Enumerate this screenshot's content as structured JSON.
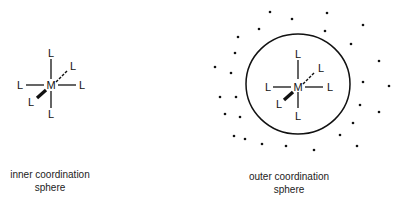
{
  "diagram": {
    "metal_symbol": "M",
    "ligand_symbol": "L",
    "inner": {
      "caption_line1": "inner coordination",
      "caption_line2": "sphere"
    },
    "outer": {
      "caption_line1": "outer coordination",
      "caption_line2": "sphere",
      "solvent_dot_count": 29
    },
    "colors": {
      "ink": "#111111",
      "background": "#ffffff"
    }
  }
}
